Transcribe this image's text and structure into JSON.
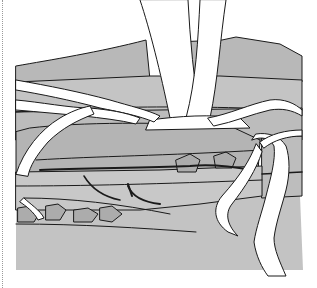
{
  "figure": {
    "alt": "Line illustration of white tree roots growing down through gray layered rock",
    "colors": {
      "background": "#ffffff",
      "rock_dark": "#b4b4b4",
      "rock_mid": "#bebebe",
      "rock_light": "#c6c6c6",
      "rock_base": "#c3c3c3",
      "root_fill": "#ffffff",
      "outline": "#1a1a1a",
      "border_dots": "#9a9a9a"
    }
  }
}
